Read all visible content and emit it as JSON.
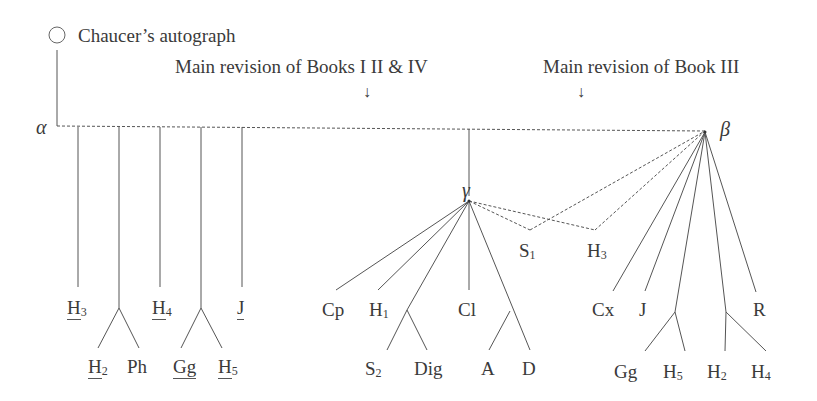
{
  "diagram": {
    "type": "stemma",
    "root": {
      "label": "Chauceer's autograph",
      "icon": "circle-icon"
    },
    "annotations": [
      {
        "id": "rev1",
        "label": "Main revision of Books I II & IV",
        "arrow": "down-arrow-icon"
      },
      {
        "id": "rev2",
        "label": "Main revision of Book III",
        "arrow": "down-arrow-icon"
      }
    ],
    "nodes": {
      "alpha": "α",
      "beta": "β",
      "gamma": "γ"
    },
    "alpha_witnesses": [
      {
        "sigil": "H",
        "sub": "3",
        "underlined": true
      },
      {
        "group": [
          {
            "sigil": "H",
            "sub": "2",
            "underlined": true
          },
          {
            "sigil": "Ph",
            "sub": "",
            "underlined": false
          }
        ]
      },
      {
        "sigil": "H",
        "sub": "4",
        "underlined": true
      },
      {
        "group": [
          {
            "sigil": "Gg",
            "sub": "",
            "underlined": true
          },
          {
            "sigil": "H",
            "sub": "5",
            "underlined": true
          }
        ]
      },
      {
        "sigil": "J",
        "sub": "",
        "underlined": true
      }
    ],
    "gamma_witnesses": [
      {
        "sigil": "Cp",
        "sub": ""
      },
      {
        "sigil": "H",
        "sub": "1"
      },
      {
        "group": [
          {
            "sigil": "S",
            "sub": "2"
          },
          {
            "sigil": "Dig",
            "sub": ""
          }
        ]
      },
      {
        "sigil": "Cl",
        "sub": ""
      },
      {
        "group": [
          {
            "sigil": "A",
            "sub": ""
          },
          {
            "sigil": "D",
            "sub": ""
          }
        ]
      }
    ],
    "contaminated": [
      {
        "sigil": "S",
        "sub": "1",
        "from": [
          "gamma",
          "beta"
        ]
      },
      {
        "sigil": "H",
        "sub": "3",
        "from": [
          "gamma",
          "beta"
        ]
      }
    ],
    "beta_witnesses": [
      {
        "sigil": "Cx",
        "sub": ""
      },
      {
        "sigil": "J",
        "sub": ""
      },
      {
        "group": [
          {
            "sigil": "Gg",
            "sub": ""
          },
          {
            "sigil": "H",
            "sub": "5"
          }
        ]
      },
      {
        "group": [
          {
            "sigil": "H",
            "sub": "2"
          },
          {
            "sigil": "H",
            "sub": "4"
          }
        ]
      },
      {
        "sigil": "R",
        "sub": ""
      }
    ]
  },
  "text": {
    "root_label": "Chaucer’s autograph",
    "rev1_label": "Main revision of Books I II & IV",
    "rev2_label": "Main revision of Book III",
    "arrow": "↓",
    "alpha": "α",
    "beta": "β",
    "gamma": "γ",
    "H": "H",
    "Ph": "Ph",
    "Gg": "Gg",
    "J": "J",
    "Cp": "Cp",
    "Cl": "Cl",
    "S": "S",
    "Dig": "Dig",
    "A": "A",
    "D": "D",
    "Cx": "Cx",
    "R": "R",
    "n1": "1",
    "n2": "2",
    "n3": "3",
    "n4": "4",
    "n5": "5"
  },
  "colors": {
    "line": "#555555",
    "text": "#3a3a3a",
    "background": "#ffffff"
  }
}
